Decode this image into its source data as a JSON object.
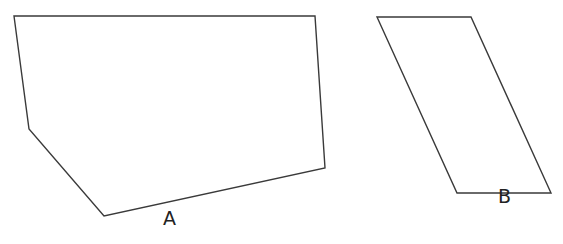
{
  "diagram": {
    "stroke_color": "#3a3a3a",
    "shapes": [
      {
        "id": "A",
        "label": "A",
        "kind": "pentagon",
        "points": "14,16 315,16 325,168 104,216 29,129",
        "label_pos": {
          "x": 163,
          "y": 226
        }
      },
      {
        "id": "B",
        "label": "B",
        "kind": "parallelogram",
        "points": "377,17 471,17 551,193 457,193",
        "label_pos": {
          "x": 498,
          "y": 204
        }
      }
    ]
  }
}
